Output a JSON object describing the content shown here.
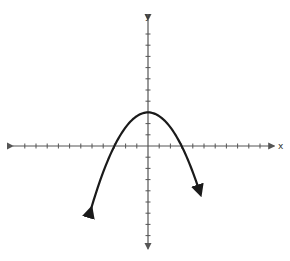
{
  "chart_data": {
    "type": "line",
    "title": "",
    "xlabel": "x",
    "ylabel": "y",
    "xlim": [
      -12,
      11
    ],
    "ylim": [
      -9,
      11
    ],
    "grid": false,
    "tick_spacing": 1,
    "tick_labels": false,
    "series": [
      {
        "name": "parabola",
        "equation": "y = 3 - x^2/3",
        "vertex": [
          0,
          3
        ],
        "x_intercepts": [
          -3,
          3
        ],
        "x": [
          -5,
          -4,
          -3,
          -2,
          -1,
          0,
          1,
          2,
          3,
          4,
          5
        ],
        "values": [
          -5.33,
          -2.33,
          0,
          1.67,
          2.67,
          3,
          2.67,
          1.67,
          0,
          -2.33,
          -5.33
        ],
        "arrows_at_ends": true,
        "color": "#1a1a1a"
      }
    ]
  },
  "axes": {
    "x_label": "x",
    "y_label": "y",
    "color": "#555555"
  }
}
